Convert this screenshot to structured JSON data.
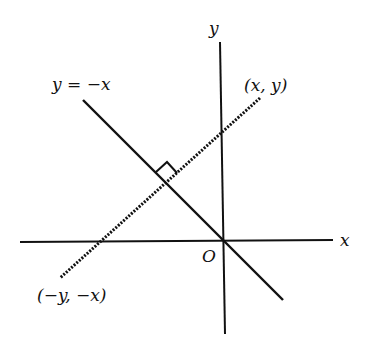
{
  "diagram": {
    "axes": {
      "x_label": "x",
      "y_label": "y",
      "origin_label": "O"
    },
    "line_label": "y = −x",
    "point_label": "(x, y)",
    "reflected_point_label": "(−y, −x)",
    "colors": {
      "stroke": "#111111",
      "background": "#ffffff"
    }
  }
}
